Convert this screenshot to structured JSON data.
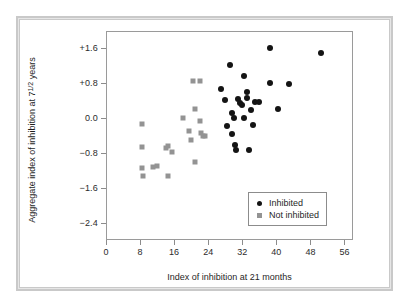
{
  "chart_data": {
    "type": "scatter",
    "title": "",
    "xlabel": "Index of inhibition at 21 months",
    "ylabel_prefix": "Aggregate index of inhibition at 7",
    "ylabel_fraction_num": "1",
    "ylabel_fraction_den": "2",
    "ylabel_suffix": " years",
    "ylabel_plain": "Aggregate index of inhibition at 7 1/2 years",
    "xlim": [
      0,
      58
    ],
    "ylim": [
      -2.8,
      2.0
    ],
    "xticks": [
      0,
      8,
      16,
      24,
      32,
      40,
      48,
      56
    ],
    "xticklabels": [
      "0",
      "8",
      "16",
      "24",
      "32",
      "40",
      "48",
      "56"
    ],
    "yticks": [
      1.6,
      0.8,
      0.0,
      -0.8,
      -1.6,
      -2.4
    ],
    "yticklabels": [
      "+1.6",
      "+0.8",
      "0.0",
      "−0.8",
      "−1.6",
      "−2.4"
    ],
    "grid": false,
    "legend_position": "lower right",
    "series": [
      {
        "name": "Inhibited",
        "marker": "circle",
        "color": "#141414",
        "points": [
          [
            27.0,
            0.66
          ],
          [
            28.0,
            0.42
          ],
          [
            28.5,
            -0.18
          ],
          [
            29.0,
            1.21
          ],
          [
            29.5,
            0.12
          ],
          [
            29.5,
            -0.37
          ],
          [
            30.0,
            0.01
          ],
          [
            30.2,
            -0.62
          ],
          [
            30.5,
            -0.74
          ],
          [
            31.0,
            0.44
          ],
          [
            31.5,
            0.34
          ],
          [
            32.0,
            0.3
          ],
          [
            32.3,
            0.97
          ],
          [
            32.5,
            0.0
          ],
          [
            33.0,
            0.45
          ],
          [
            33.2,
            0.61
          ],
          [
            33.5,
            -0.74
          ],
          [
            34.0,
            0.19
          ],
          [
            34.5,
            -0.16
          ],
          [
            35.0,
            0.36
          ],
          [
            36.0,
            0.37
          ],
          [
            38.5,
            1.6
          ],
          [
            38.5,
            0.81
          ],
          [
            40.5,
            0.21
          ],
          [
            43.0,
            0.79
          ],
          [
            50.5,
            1.49
          ]
        ]
      },
      {
        "name": "Not inhibited",
        "marker": "square",
        "color": "#939393",
        "points": [
          [
            8.5,
            -0.14
          ],
          [
            8.5,
            -0.66
          ],
          [
            8.5,
            -1.14
          ],
          [
            8.6,
            -1.33
          ],
          [
            11.0,
            -1.13
          ],
          [
            12.0,
            -1.1
          ],
          [
            14.0,
            -0.68
          ],
          [
            14.5,
            -0.63
          ],
          [
            14.6,
            -1.33
          ],
          [
            15.5,
            -0.79
          ],
          [
            18.0,
            0.01
          ],
          [
            19.5,
            -0.29
          ],
          [
            20.0,
            -0.51
          ],
          [
            20.5,
            0.85
          ],
          [
            20.8,
            0.22
          ],
          [
            21.0,
            -1.01
          ],
          [
            22.0,
            0.85
          ],
          [
            22.0,
            -0.06
          ],
          [
            22.2,
            -0.34
          ],
          [
            22.8,
            -0.4
          ],
          [
            23.2,
            -0.41
          ]
        ]
      }
    ]
  },
  "legend": {
    "items": [
      {
        "label": "Inhibited",
        "marker": "circle"
      },
      {
        "label": "Not inhibited",
        "marker": "square"
      }
    ]
  }
}
